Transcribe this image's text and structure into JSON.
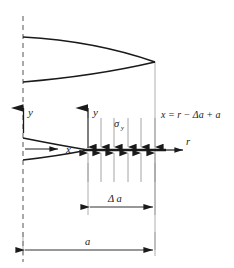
{
  "figure": {
    "background_color": "#ffffff",
    "line_color": "#1a1a1a",
    "thin_line_color": "#8a8a8a"
  },
  "labels": {
    "y_axis_left": "y",
    "y_axis_tip": "y",
    "x_axis_crack": "x",
    "r_axis": "r",
    "stress_symbol": "σ",
    "stress_subscript": "y",
    "equation": "x = r − Δa + a",
    "delta_a_dimension": "Δ a",
    "a_dimension": "a"
  },
  "geometry": {
    "centerline_x": 23,
    "tip_line_x": 155,
    "crack_line_y": 150,
    "cohesive_zone_start_x": 88,
    "cohesive_zone_end_x": 155,
    "upper_crack_left_top_y": 37,
    "upper_crack_left_bottom_y": 82,
    "upper_crack_tip_x": 155,
    "upper_crack_tip_y": 62,
    "lower_crack_left_top_y": 138,
    "lower_crack_left_bottom_y": 160,
    "lower_crack_tip_x": 88,
    "delta_a_dim_y": 207,
    "a_dim_y": 250
  },
  "stress_arrows": {
    "count": 6,
    "x_positions": [
      88,
      101,
      114,
      128,
      141,
      155
    ],
    "upper_start_y": 118,
    "lower_end_y": 182,
    "direction_upper": "down",
    "direction_lower": "up"
  }
}
